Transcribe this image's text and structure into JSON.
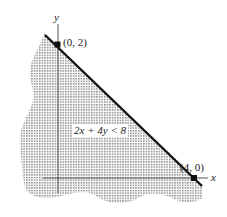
{
  "diagram": {
    "type": "linear-inequality-graph",
    "inequality_label": "2x + 4y < 8",
    "axes": {
      "x_label": "x",
      "y_label": "y"
    },
    "points": [
      {
        "label": "(0, 2)",
        "x": 0,
        "y": 2
      },
      {
        "label": "(4, 0)",
        "x": 4,
        "y": 0
      }
    ],
    "boundary_line": "2x + 4y = 8",
    "boundary_style": "solid",
    "shaded_side": "below-left",
    "colors": {
      "line": "#111111",
      "axis": "#555555",
      "shading_dot": "#888888",
      "background": "#ffffff"
    }
  }
}
